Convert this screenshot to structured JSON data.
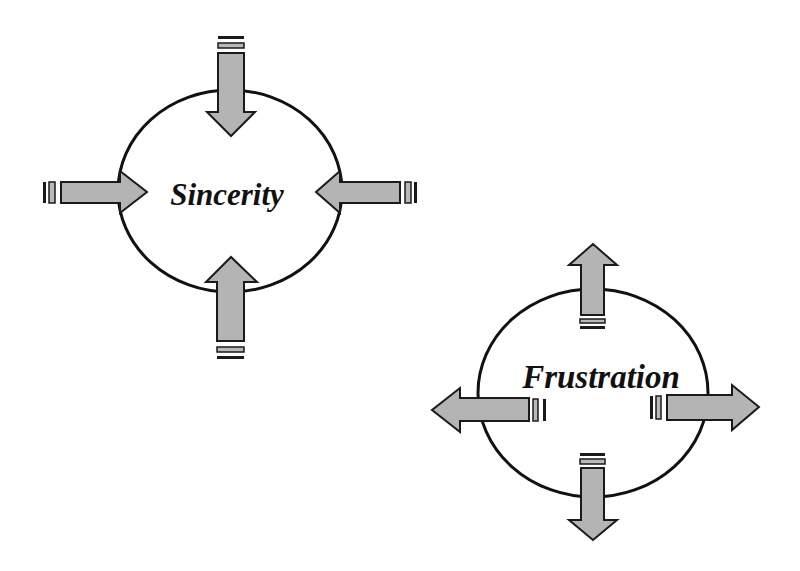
{
  "colors": {
    "background": "#ffffff",
    "outline": "#111111",
    "arrow_fill": "#b4b4b4"
  },
  "diagrams": [
    {
      "id": "sincerity",
      "label": "Sincerity",
      "arrow_direction": "inward",
      "arrows": [
        "top-arrow-inward",
        "left-arrow-inward",
        "right-arrow-inward",
        "bottom-arrow-inward"
      ]
    },
    {
      "id": "frustration",
      "label": "Frustration",
      "arrow_direction": "outward",
      "arrows": [
        "top-arrow-outward",
        "left-arrow-outward",
        "right-arrow-outward",
        "bottom-arrow-outward"
      ]
    }
  ]
}
